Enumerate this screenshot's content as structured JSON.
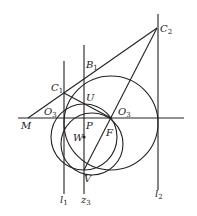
{
  "diagram": {
    "type": "geometry-construction",
    "points": [
      {
        "id": "C2",
        "name": "C",
        "sub": "2",
        "x": 157,
        "y": 28,
        "lx": 160,
        "ly": 32
      },
      {
        "id": "B1",
        "name": "B",
        "sub": "1",
        "x": 84,
        "y": 72,
        "lx": 86,
        "ly": 68
      },
      {
        "id": "C1",
        "name": "C",
        "sub": "1",
        "x": 64,
        "y": 93,
        "lx": 51,
        "ly": 91
      },
      {
        "id": "U",
        "name": "U",
        "sub": "",
        "x": 84,
        "y": 103,
        "lx": 86,
        "ly": 101
      },
      {
        "id": "O3a",
        "name": "O",
        "sub": "3",
        "x": 64,
        "y": 118,
        "lx": 44,
        "ly": 115
      },
      {
        "id": "O3b",
        "name": "O",
        "sub": "3",
        "x": 111,
        "y": 118,
        "lx": 118,
        "ly": 115
      },
      {
        "id": "M",
        "name": "M",
        "sub": "",
        "x": 28,
        "y": 118,
        "lx": 21,
        "ly": 129
      },
      {
        "id": "P",
        "name": "P",
        "sub": "",
        "x": 84,
        "y": 118,
        "lx": 86,
        "ly": 129
      },
      {
        "id": "W",
        "name": "W",
        "sub": "",
        "x": 84,
        "y": 137,
        "lx": 73,
        "ly": 141
      },
      {
        "id": "F",
        "name": "F",
        "sub": "",
        "x": 111,
        "y": 118,
        "lx": 106,
        "ly": 136
      },
      {
        "id": "V",
        "name": "V",
        "sub": "",
        "x": 84,
        "y": 170,
        "lx": 84,
        "ly": 182
      }
    ],
    "line_labels": [
      {
        "id": "l1",
        "name": "l",
        "sub": "1",
        "lx": 60,
        "ly": 203
      },
      {
        "id": "z3",
        "name": "z",
        "sub": "3",
        "lx": 81,
        "ly": 203
      },
      {
        "id": "l2",
        "name": "l",
        "sub": "2",
        "lx": 155,
        "ly": 197
      }
    ],
    "colors": {
      "stroke": "#222222",
      "background": "#ffffff"
    }
  }
}
